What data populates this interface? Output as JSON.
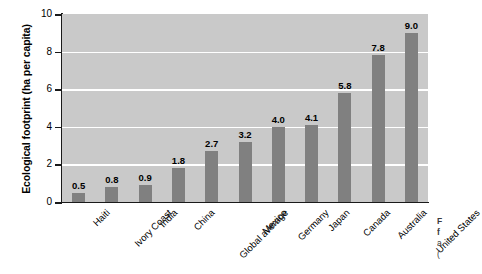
{
  "chart_data": {
    "type": "bar",
    "title": "",
    "subtitle": "",
    "xlabel": "",
    "ylabel": "Ecological footprint (ha per capita)",
    "ylim": [
      0,
      10
    ],
    "ytick_labels": [
      "0",
      "2",
      "4",
      "6",
      "8",
      "10"
    ],
    "ytick_values": [
      0,
      2,
      4,
      6,
      8,
      10
    ],
    "grid": "horizontal-white-gridlines",
    "legend": "none",
    "orientation": "vertical",
    "categories": [
      "Haiti",
      "Ivory Coast",
      "India",
      "China",
      "Global average",
      "Mexico",
      "Germany",
      "Japan",
      "Canada",
      "Australia",
      "United States"
    ],
    "values": [
      0.5,
      0.8,
      0.9,
      1.8,
      2.7,
      3.2,
      4.0,
      4.1,
      5.8,
      7.8,
      9.0
    ],
    "value_labels": [
      "0.5",
      "0.8",
      "0.9",
      "1.8",
      "2.7",
      "3.2",
      "4.0",
      "4.1",
      "5.8",
      "7.8",
      "9.0"
    ],
    "colors": {
      "bar": "#808080",
      "plot_background": "#c9c9c9",
      "gridline": "#ffffff",
      "axis": "#1a1a1a",
      "text": "#000000",
      "figure_background": "#ffffff"
    }
  },
  "caption": {
    "line1": "F",
    "line2": "f",
    "line3": "a",
    "line4": "("
  }
}
